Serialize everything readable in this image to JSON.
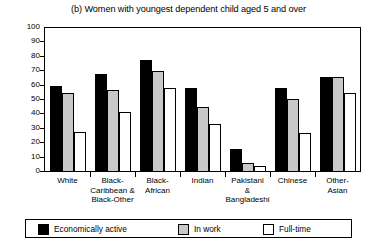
{
  "chart_data": {
    "type": "bar",
    "title": "(b) Women with youngest dependent child aged 5 and over",
    "xlabel": "",
    "ylabel": "",
    "ylim": [
      0,
      100
    ],
    "ytick_labels": [
      "100",
      "90",
      "80",
      "70",
      "60",
      "50",
      "40",
      "30",
      "20",
      "10",
      "0"
    ],
    "yticks": [
      100,
      90,
      80,
      70,
      60,
      50,
      40,
      30,
      20,
      10,
      0
    ],
    "grid": false,
    "legend_position": "bottom",
    "categories": [
      "White",
      "Black-Caribbean & Black-Other",
      "Black-African",
      "Indian",
      "Pakistani & Bangladeshi",
      "Chinese",
      "Other-Asian"
    ],
    "category_label_lines": [
      [
        "White"
      ],
      [
        "Black-",
        "Caribbean &",
        "Black-Other"
      ],
      [
        "Black-",
        "African"
      ],
      [
        "Indian"
      ],
      [
        "Pakistani",
        "&",
        "Bangladeshi"
      ],
      [
        "Chinese"
      ],
      [
        "Other-",
        "Asian"
      ]
    ],
    "series": [
      {
        "name": "Economically active",
        "color": "#000000",
        "values": [
          60,
          68,
          78,
          58,
          16,
          58,
          66
        ]
      },
      {
        "name": "In work",
        "color": "#c8c8c8",
        "values": [
          55,
          57,
          70,
          45,
          6,
          51,
          66
        ]
      },
      {
        "name": "Full-time",
        "color": "#ffffff",
        "values": [
          28,
          42,
          58,
          33,
          4,
          27,
          55
        ]
      }
    ]
  },
  "legend": {
    "entries": [
      {
        "label": "Economically active",
        "color": "#000000"
      },
      {
        "label": "In work",
        "color": "#c8c8c8"
      },
      {
        "label": "Full-time",
        "color": "#ffffff"
      }
    ]
  }
}
